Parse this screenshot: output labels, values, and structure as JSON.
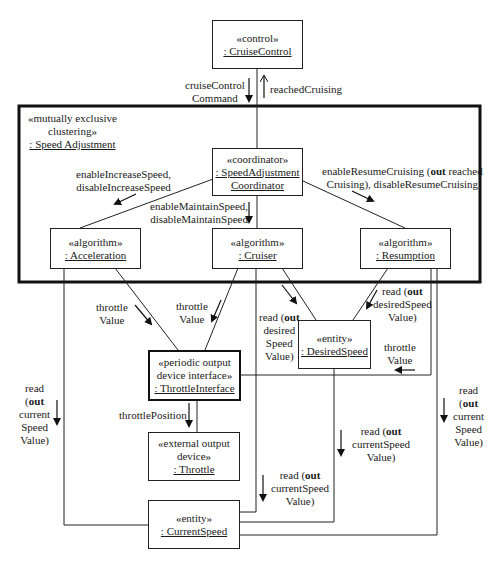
{
  "diagram": {
    "type": "UML communication diagram",
    "objects": {
      "cruise_control": {
        "stereotype": "«control»",
        "name": ": CruiseControl"
      },
      "speed_adjustment": {
        "stereotype_line1": "«mutually exclusive",
        "stereotype_line2": "clustering»",
        "name": ": Speed Adjustment"
      },
      "coordinator": {
        "stereotype": "«coordinator»",
        "name_line1": ": SpeedAdjustment",
        "name_line2": "Coordinator"
      },
      "acceleration": {
        "stereotype": "«algorithm»",
        "name": ": Acceleration"
      },
      "cruiser": {
        "stereotype": "«algorithm»",
        "name": ": Cruiser"
      },
      "resumption": {
        "stereotype": "«algorithm»",
        "name": ": Resumption"
      },
      "throttle_interface": {
        "stereotype_line1": "«periodic output",
        "stereotype_line2": "device interface»",
        "name": ": ThrottleInterface"
      },
      "desired_speed": {
        "stereotype": "«entity»",
        "name": ": DesiredSpeed"
      },
      "throttle": {
        "stereotype_line1": "«external output",
        "stereotype_line2": "device»",
        "name": ": Throttle"
      },
      "current_speed": {
        "stereotype": "«entity»",
        "name": ": CurrentSpeed"
      }
    },
    "messages": {
      "cruise_control_command": {
        "line1": "cruiseControl",
        "line2": "Command"
      },
      "reached_cruising": {
        "text": "reachedCruising"
      },
      "increase_speed": {
        "line1": "enableIncreaseSpeed,",
        "line2": "disableIncreaseSpeed"
      },
      "maintain_speed": {
        "line1": "enableMaintainSpeed,",
        "line2": "disableMaintainSpeed"
      },
      "resume_cruising": {
        "line1_a": "enableResumeCruising (",
        "line1_bold": "out",
        "line1_b": " reached",
        "line2": "Cruising), disableResumeCruising"
      },
      "throttle_value_accel": {
        "line1": "throttle",
        "line2": "Value"
      },
      "throttle_value_cruiser": {
        "line1": "throttle",
        "line2": "Value"
      },
      "read_desired_cruiser": {
        "line1_a": "read (",
        "line1_bold": "out",
        "line2": "desired",
        "line3": "Speed",
        "line4": "Value)"
      },
      "read_desired_resumption": {
        "line1_a": "read (",
        "line1_bold": "out",
        "line2": "desiredSpeed",
        "line3": "Value)"
      },
      "throttle_value_resumption": {
        "line1": "throttle",
        "line2": "Value"
      },
      "throttle_position": {
        "text": "throttlePosition"
      },
      "read_current_accel": {
        "line1": "read",
        "line2_a": "(",
        "line2_bold": "out",
        "line3": "current",
        "line4": "Speed",
        "line5": "Value)"
      },
      "read_current_resumption": {
        "line1": "read",
        "line2_a": "(",
        "line2_bold": "out",
        "line3": "current",
        "line4": "Speed",
        "line5": "Value)"
      },
      "read_current_cruiser_upper": {
        "line1_a": "read (",
        "line1_bold": "out",
        "line2": "currentSpeed",
        "line3": "Value)"
      },
      "read_current_cruiser_lower": {
        "line1_a": "read (",
        "line1_bold": "out",
        "line2": "currentSpeed",
        "line3": "Value)"
      }
    }
  }
}
